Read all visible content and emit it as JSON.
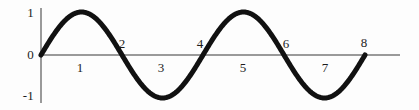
{
  "chart_data": {
    "type": "line",
    "title": "",
    "subtitle": "",
    "xlabel": "",
    "ylabel": "",
    "function": "sin",
    "legend": [],
    "grid": false,
    "xlim": [
      0,
      9
    ],
    "ylim": [
      -1,
      1
    ],
    "x_ticks": [
      {
        "value": 1,
        "label": "1",
        "position": "below-axis"
      },
      {
        "value": 2,
        "label": "2",
        "position": "above-axis"
      },
      {
        "value": 3,
        "label": "3",
        "position": "below-axis"
      },
      {
        "value": 4,
        "label": "4",
        "position": "above-axis"
      },
      {
        "value": 5,
        "label": "5",
        "position": "below-axis"
      },
      {
        "value": 6,
        "label": "6",
        "position": "above-axis"
      },
      {
        "value": 7,
        "label": "7",
        "position": "below-axis"
      },
      {
        "value": 8,
        "label": "8",
        "position": "above-axis"
      }
    ],
    "y_ticks": [
      {
        "value": 1,
        "label": "1"
      },
      {
        "value": 0,
        "label": "0"
      },
      {
        "value": -1,
        "label": "-1"
      }
    ],
    "x": [
      0,
      0.25,
      0.5,
      0.75,
      1,
      1.25,
      1.5,
      1.75,
      2,
      2.25,
      2.5,
      2.75,
      3,
      3.25,
      3.5,
      3.75,
      4,
      4.25,
      4.5,
      4.75,
      5,
      5.25,
      5.5,
      5.75,
      6,
      6.25,
      6.5,
      6.75,
      7,
      7.25,
      7.5,
      7.75,
      8
    ],
    "y": [
      0,
      0.38,
      0.71,
      0.92,
      1,
      0.92,
      0.71,
      0.38,
      0,
      -0.38,
      -0.71,
      -0.92,
      -1,
      -0.92,
      -0.71,
      -0.38,
      0,
      0.38,
      0.71,
      0.92,
      1,
      0.92,
      0.71,
      0.38,
      0,
      -0.38,
      -0.71,
      -0.92,
      -1,
      -0.92,
      -0.71,
      -0.38,
      0
    ],
    "key_points": {
      "zero_crossings": [
        0,
        2,
        4,
        6,
        8
      ],
      "maxima": [
        {
          "x": 1,
          "y": 1
        },
        {
          "x": 5,
          "y": 1
        }
      ],
      "minima": [
        {
          "x": 3,
          "y": -1
        },
        {
          "x": 7,
          "y": -1
        }
      ],
      "period": 4,
      "amplitude": 1
    },
    "colors": {
      "curve": "#111111",
      "axis": "#9a9a9a",
      "text": "#1c1c1c",
      "background": "#fdfdfd"
    },
    "curve_width_px": 5
  }
}
